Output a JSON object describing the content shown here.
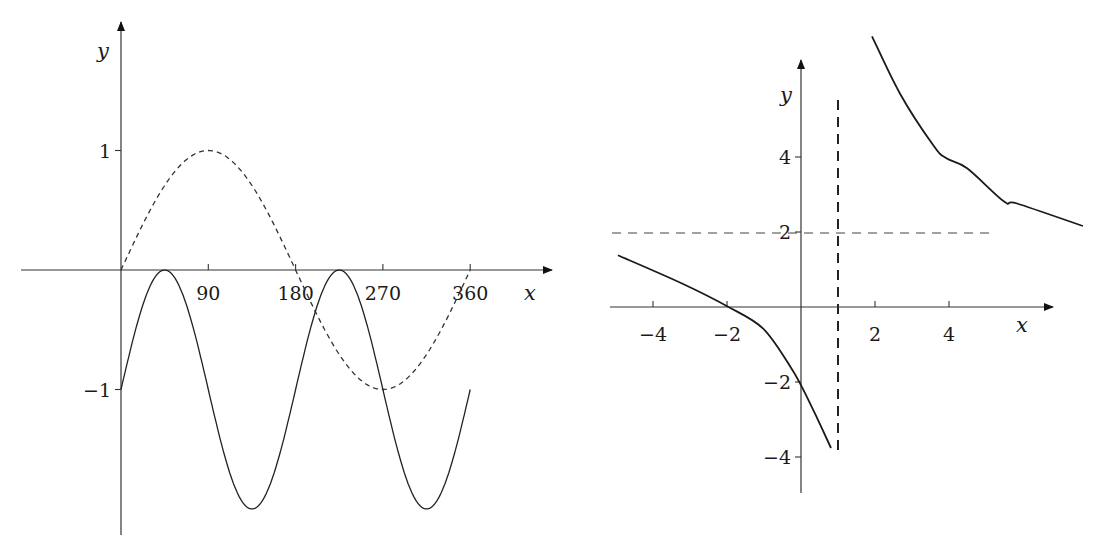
{
  "chart_data": [
    {
      "type": "line",
      "title": "",
      "xlabel": "x",
      "ylabel": "y",
      "x_ticks": [
        90,
        180,
        270,
        360
      ],
      "x_tick_labels": [
        "90",
        "180",
        "270",
        "360"
      ],
      "y_ticks": [
        1,
        -1
      ],
      "y_tick_labels": [
        "1",
        "−1"
      ],
      "xlim": [
        -104,
        444
      ],
      "ylim": [
        -2.2,
        2.0
      ],
      "grid": false,
      "legend": null,
      "series": [
        {
          "name": "y = sin x",
          "style": "dashed",
          "function": "sin(x)",
          "domain": [
            0,
            360
          ]
        },
        {
          "name": "y = sin 2x − 1",
          "style": "solid",
          "function": "sin(2x) - 1",
          "domain": [
            0,
            360
          ]
        }
      ],
      "key_points": {
        "dashed": [
          [
            0,
            0
          ],
          [
            90,
            1
          ],
          [
            180,
            0
          ],
          [
            270,
            -1
          ],
          [
            360,
            0
          ]
        ],
        "solid": [
          [
            0,
            -1
          ],
          [
            45,
            0
          ],
          [
            135,
            -2
          ],
          [
            225,
            0
          ],
          [
            315,
            -2
          ],
          [
            360,
            -1
          ]
        ]
      }
    },
    {
      "type": "line",
      "title": "",
      "xlabel": "x",
      "ylabel": "y",
      "x_ticks": [
        -4,
        -2,
        2,
        4
      ],
      "x_tick_labels": [
        "−4",
        "−2",
        "2",
        "4"
      ],
      "y_ticks": [
        4,
        2,
        -2,
        -4
      ],
      "y_tick_labels": [
        "4",
        "2",
        "−2",
        "−4"
      ],
      "xlim": [
        -5.2,
        6.8
      ],
      "ylim": [
        -5.2,
        6.7
      ],
      "grid": false,
      "legend": null,
      "asymptotes": {
        "vertical": 1,
        "horizontal": 2
      },
      "series": [
        {
          "name": "left branch",
          "style": "solid",
          "x": [
            -4.95,
            -3.2,
            -1.96,
            -1.03,
            -0.3,
            0.03,
            0.43,
            0.81
          ],
          "y": [
            1.38,
            0.62,
            0.0,
            -0.57,
            -1.57,
            -2.14,
            -2.95,
            -3.76
          ]
        },
        {
          "name": "right branch",
          "style": "solid",
          "x": [
            1.92,
            2.68,
            3.57,
            3.92,
            4.49,
            5.49,
            5.84,
            7.62
          ],
          "y": [
            7.22,
            5.68,
            4.32,
            3.97,
            3.7,
            2.81,
            2.97,
            2.16
          ]
        }
      ]
    }
  ]
}
